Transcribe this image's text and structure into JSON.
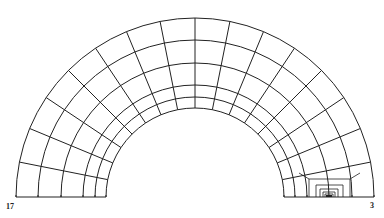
{
  "diagram": {
    "type": "finite-element-mesh-half-annulus",
    "center": [
      195,
      197
    ],
    "radii": [
      89,
      100,
      112,
      134,
      157,
      179
    ],
    "angular_divisions": 16,
    "line_color": "#222222",
    "background": "#ffffff",
    "refined_region": {
      "apex": [
        329,
        197
      ],
      "levels": [
        {
          "top_y": 179,
          "x_left": 309,
          "x_right": 350
        },
        {
          "top_y": 185,
          "x_left": 316,
          "x_right": 343
        },
        {
          "top_y": 189,
          "x_left": 320,
          "x_right": 338
        },
        {
          "top_y": 192,
          "x_left": 323,
          "x_right": 335
        },
        {
          "top_y": 194,
          "x_left": 325,
          "x_right": 333
        },
        {
          "top_y": 196,
          "x_left": 327,
          "x_right": 331
        }
      ]
    }
  },
  "labels": {
    "left_node": "17",
    "right_node": "3"
  }
}
